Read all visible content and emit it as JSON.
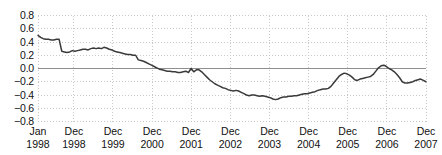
{
  "chart_data": {
    "type": "line",
    "title": "",
    "xlabel": "",
    "ylabel": "",
    "ylim": [
      -0.8,
      0.8
    ],
    "ytick_labels": [
      "0.8",
      "0.6",
      "0.4",
      "0.2",
      "0.0",
      "−0.2",
      "−0.4",
      "−0.6",
      "−0.8"
    ],
    "ytick_values": [
      0.8,
      0.6,
      0.4,
      0.2,
      0.0,
      -0.2,
      -0.4,
      -0.6,
      -0.8
    ],
    "grid": true,
    "legend": "none",
    "zero_line": true,
    "xtick_labels": [
      {
        "top": "Jan",
        "bottom": "1998"
      },
      {
        "top": "Dec",
        "bottom": "1998"
      },
      {
        "top": "Dec",
        "bottom": "1999"
      },
      {
        "top": "Dec",
        "bottom": "2000"
      },
      {
        "top": "Dec",
        "bottom": "2001"
      },
      {
        "top": "Dec",
        "bottom": "2002"
      },
      {
        "top": "Dec",
        "bottom": "2003"
      },
      {
        "top": "Dec",
        "bottom": "2004"
      },
      {
        "top": "Dec",
        "bottom": "2005"
      },
      {
        "top": "Dec",
        "bottom": "2006"
      },
      {
        "top": "Dec",
        "bottom": "2007"
      }
    ],
    "xtick_positions": [
      0,
      11,
      23,
      35,
      47,
      59,
      71,
      83,
      95,
      107,
      119
    ],
    "x_index_range": [
      0,
      119
    ],
    "series": [
      {
        "name": "series-1",
        "color": "#3a3a3a",
        "values": [
          0.5,
          0.47,
          0.45,
          0.44,
          0.44,
          0.43,
          0.43,
          0.44,
          0.44,
          0.26,
          0.25,
          0.24,
          0.25,
          0.27,
          0.26,
          0.27,
          0.28,
          0.29,
          0.29,
          0.28,
          0.3,
          0.31,
          0.3,
          0.31,
          0.3,
          0.32,
          0.31,
          0.29,
          0.28,
          0.26,
          0.25,
          0.24,
          0.23,
          0.22,
          0.21,
          0.21,
          0.2,
          0.2,
          0.13,
          0.12,
          0.11,
          0.09,
          0.07,
          0.05,
          0.03,
          0.01,
          -0.01,
          -0.02,
          -0.03,
          -0.04,
          -0.04,
          -0.05,
          -0.05,
          -0.06,
          -0.06,
          -0.05,
          -0.04,
          -0.06,
          0.0,
          -0.05,
          -0.02,
          -0.02,
          -0.05,
          -0.09,
          -0.13,
          -0.17,
          -0.2,
          -0.23,
          -0.25,
          -0.27,
          -0.29,
          -0.3,
          -0.32,
          -0.33,
          -0.34,
          -0.33,
          -0.34,
          -0.36,
          -0.38,
          -0.4,
          -0.41,
          -0.4,
          -0.4,
          -0.41,
          -0.42,
          -0.41,
          -0.42,
          -0.43,
          -0.44,
          -0.46,
          -0.47,
          -0.46,
          -0.44,
          -0.43,
          -0.43,
          -0.42,
          -0.42,
          -0.41,
          -0.41,
          -0.4,
          -0.39,
          -0.38,
          -0.38,
          -0.37,
          -0.36,
          -0.35,
          -0.33,
          -0.32,
          -0.31,
          -0.31,
          -0.3,
          -0.27,
          -0.22,
          -0.17,
          -0.12,
          -0.09,
          -0.07,
          -0.08,
          -0.1,
          -0.13,
          -0.17,
          -0.18,
          -0.16,
          -0.15,
          -0.14,
          -0.13,
          -0.12,
          -0.09,
          -0.04,
          0.01,
          0.04,
          0.05,
          0.03,
          0.0,
          -0.02,
          -0.05,
          -0.09,
          -0.14,
          -0.2,
          -0.22,
          -0.22,
          -0.21,
          -0.2,
          -0.18,
          -0.17,
          -0.16,
          -0.18,
          -0.2
        ]
      }
    ]
  },
  "style": {
    "grid_color": "#c9c9c9",
    "zero_line_color": "#8f8f8f",
    "axis_text_color": "#111111",
    "line_color": "#3a3a3a",
    "background": "#ffffff"
  }
}
